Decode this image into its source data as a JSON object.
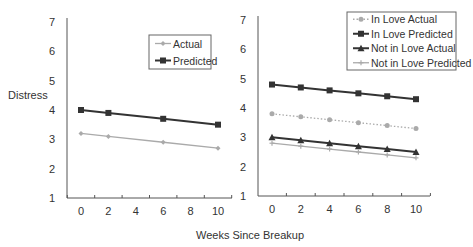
{
  "chart_data": [
    {
      "type": "line",
      "title": "",
      "xlabel": "Weeks Since Breakup",
      "ylabel": "Distress",
      "ylim": [
        1,
        7
      ],
      "yticks": [
        "1",
        "2",
        "3",
        "4",
        "5",
        "6",
        "7"
      ],
      "xticks": [
        "0",
        "2",
        "4",
        "6",
        "8",
        "10"
      ],
      "grid": false,
      "legend_position": "upper right",
      "series": [
        {
          "name": "Actual",
          "x": [
            0,
            2,
            6,
            10
          ],
          "values": [
            3.2,
            3.1,
            2.9,
            2.7
          ],
          "color": "#aaaaaa",
          "marker": "diamond",
          "style": "solid"
        },
        {
          "name": "Predicted",
          "x": [
            0,
            2,
            6,
            10
          ],
          "values": [
            4.0,
            3.9,
            3.7,
            3.5
          ],
          "color": "#333333",
          "marker": "square",
          "style": "solid"
        }
      ]
    },
    {
      "type": "line",
      "title": "",
      "xlabel": "Weeks Since Breakup",
      "ylabel": "",
      "ylim": [
        1,
        7
      ],
      "yticks": [
        "1",
        "2",
        "3",
        "4",
        "5",
        "6",
        "7"
      ],
      "xticks": [
        "0",
        "2",
        "4",
        "6",
        "8",
        "10"
      ],
      "grid": false,
      "legend_position": "upper right",
      "series": [
        {
          "name": "In Love Actual",
          "x": [
            0,
            2,
            4,
            6,
            8,
            10
          ],
          "values": [
            3.8,
            3.7,
            3.6,
            3.5,
            3.4,
            3.3
          ],
          "color": "#aaaaaa",
          "marker": "circle",
          "style": "dotted"
        },
        {
          "name": "In Love Predicted",
          "x": [
            0,
            2,
            4,
            6,
            8,
            10
          ],
          "values": [
            4.8,
            4.7,
            4.6,
            4.5,
            4.4,
            4.3
          ],
          "color": "#333333",
          "marker": "square",
          "style": "solid"
        },
        {
          "name": "Not in Love Actual",
          "x": [
            0,
            2,
            4,
            6,
            8,
            10
          ],
          "values": [
            3.0,
            2.9,
            2.8,
            2.7,
            2.6,
            2.5
          ],
          "color": "#333333",
          "marker": "triangle",
          "style": "solid"
        },
        {
          "name": "Not in Love Predicted",
          "x": [
            0,
            2,
            4,
            6,
            8,
            10
          ],
          "values": [
            2.8,
            2.7,
            2.6,
            2.5,
            2.4,
            2.3
          ],
          "color": "#aaaaaa",
          "marker": "plus",
          "style": "solid"
        }
      ]
    }
  ],
  "labels": {
    "ylabel": "Distress",
    "xlabel": "Weeks Since Breakup"
  }
}
